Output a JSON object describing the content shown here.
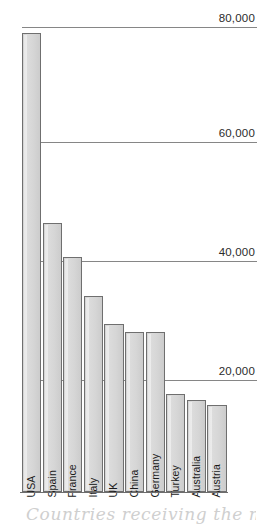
{
  "chart_data": {
    "type": "bar",
    "title": "",
    "caption": "Countries receiving the most fo",
    "xlabel": "",
    "ylabel": "",
    "categories": [
      "USA",
      "Spain",
      "France",
      "Italy",
      "UK",
      "China",
      "Germany",
      "Turkey",
      "Australia",
      "Austria"
    ],
    "values": [
      82000,
      48000,
      42000,
      35000,
      30000,
      28500,
      28500,
      17500,
      16500,
      15500
    ],
    "ylim": [
      0,
      85000
    ],
    "yticks": [
      20000,
      40000,
      60000,
      80000
    ],
    "ytick_labels": [
      "20,000",
      "40,000",
      "60,000",
      "80,000"
    ],
    "grid": true,
    "legend": false,
    "bar_fill_color": "#d6d6d6",
    "bar_border_color": "#6f6f6f",
    "gridline_color": "#868686",
    "background_color": "#ffffff"
  },
  "axis": {
    "baseline_label": "baseline"
  }
}
